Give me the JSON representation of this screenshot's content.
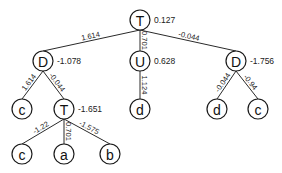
{
  "diagram": {
    "type": "tree",
    "nodes": [
      {
        "id": "n0",
        "label": "T",
        "value": "0.127",
        "x": 140,
        "y": 20
      },
      {
        "id": "n1",
        "label": "D",
        "value": "-1.078",
        "x": 43,
        "y": 61
      },
      {
        "id": "n2",
        "label": "U",
        "value": "0.628",
        "x": 140,
        "y": 61
      },
      {
        "id": "n3",
        "label": "D",
        "value": "-1.756",
        "x": 236,
        "y": 61
      },
      {
        "id": "n4",
        "label": "c",
        "value": "",
        "x": 22,
        "y": 109
      },
      {
        "id": "n5",
        "label": "T",
        "value": "-1.651",
        "x": 64,
        "y": 109
      },
      {
        "id": "n6",
        "label": "d",
        "value": "",
        "x": 140,
        "y": 109
      },
      {
        "id": "n7",
        "label": "d",
        "value": "",
        "x": 217,
        "y": 109
      },
      {
        "id": "n8",
        "label": "c",
        "value": "",
        "x": 258,
        "y": 109
      },
      {
        "id": "n9",
        "label": "c",
        "value": "",
        "x": 22,
        "y": 154
      },
      {
        "id": "n10",
        "label": "a",
        "value": "",
        "x": 64,
        "y": 154
      },
      {
        "id": "n11",
        "label": "b",
        "value": "",
        "x": 110,
        "y": 154
      }
    ],
    "edges": [
      {
        "from": "n0",
        "to": "n1",
        "weight": "1.614"
      },
      {
        "from": "n0",
        "to": "n2",
        "weight": "0.701"
      },
      {
        "from": "n0",
        "to": "n3",
        "weight": "-0.044"
      },
      {
        "from": "n1",
        "to": "n4",
        "weight": "1.614"
      },
      {
        "from": "n1",
        "to": "n5",
        "weight": "-0.044"
      },
      {
        "from": "n2",
        "to": "n6",
        "weight": "1.124"
      },
      {
        "from": "n3",
        "to": "n7",
        "weight": "-0.044"
      },
      {
        "from": "n3",
        "to": "n8",
        "weight": "-0.94"
      },
      {
        "from": "n5",
        "to": "n9",
        "weight": "-1.22"
      },
      {
        "from": "n5",
        "to": "n10",
        "weight": "0.701"
      },
      {
        "from": "n5",
        "to": "n11",
        "weight": "-1.575"
      }
    ]
  }
}
